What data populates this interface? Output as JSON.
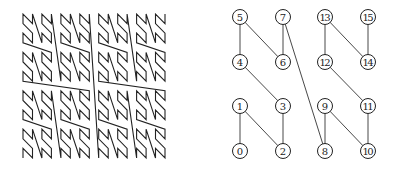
{
  "left_figure": {
    "description": "N-order (Morton) space-filling curve, 16x16 grid",
    "order": 4,
    "bounds": {
      "x0": 23,
      "y0": 14,
      "x1": 165,
      "y1": 158
    },
    "stroke_color": "#222222"
  },
  "right_figure": {
    "description": "N-order curve on 4x4 grid with numbered nodes",
    "columns_x": [
      240,
      283,
      325,
      368
    ],
    "rows_y": [
      151,
      106,
      62,
      17
    ],
    "node_radius": 7.5,
    "nodes": [
      {
        "label": "0",
        "col": 0,
        "row": 0
      },
      {
        "label": "1",
        "col": 0,
        "row": 1
      },
      {
        "label": "2",
        "col": 1,
        "row": 0
      },
      {
        "label": "3",
        "col": 1,
        "row": 1
      },
      {
        "label": "4",
        "col": 0,
        "row": 2
      },
      {
        "label": "5",
        "col": 0,
        "row": 3
      },
      {
        "label": "6",
        "col": 1,
        "row": 2
      },
      {
        "label": "7",
        "col": 1,
        "row": 3
      },
      {
        "label": "8",
        "col": 2,
        "row": 0
      },
      {
        "label": "9",
        "col": 2,
        "row": 1
      },
      {
        "label": "10",
        "col": 3,
        "row": 0
      },
      {
        "label": "11",
        "col": 3,
        "row": 1
      },
      {
        "label": "12",
        "col": 2,
        "row": 2
      },
      {
        "label": "13",
        "col": 2,
        "row": 3
      },
      {
        "label": "14",
        "col": 3,
        "row": 2
      },
      {
        "label": "15",
        "col": 3,
        "row": 3
      }
    ]
  }
}
